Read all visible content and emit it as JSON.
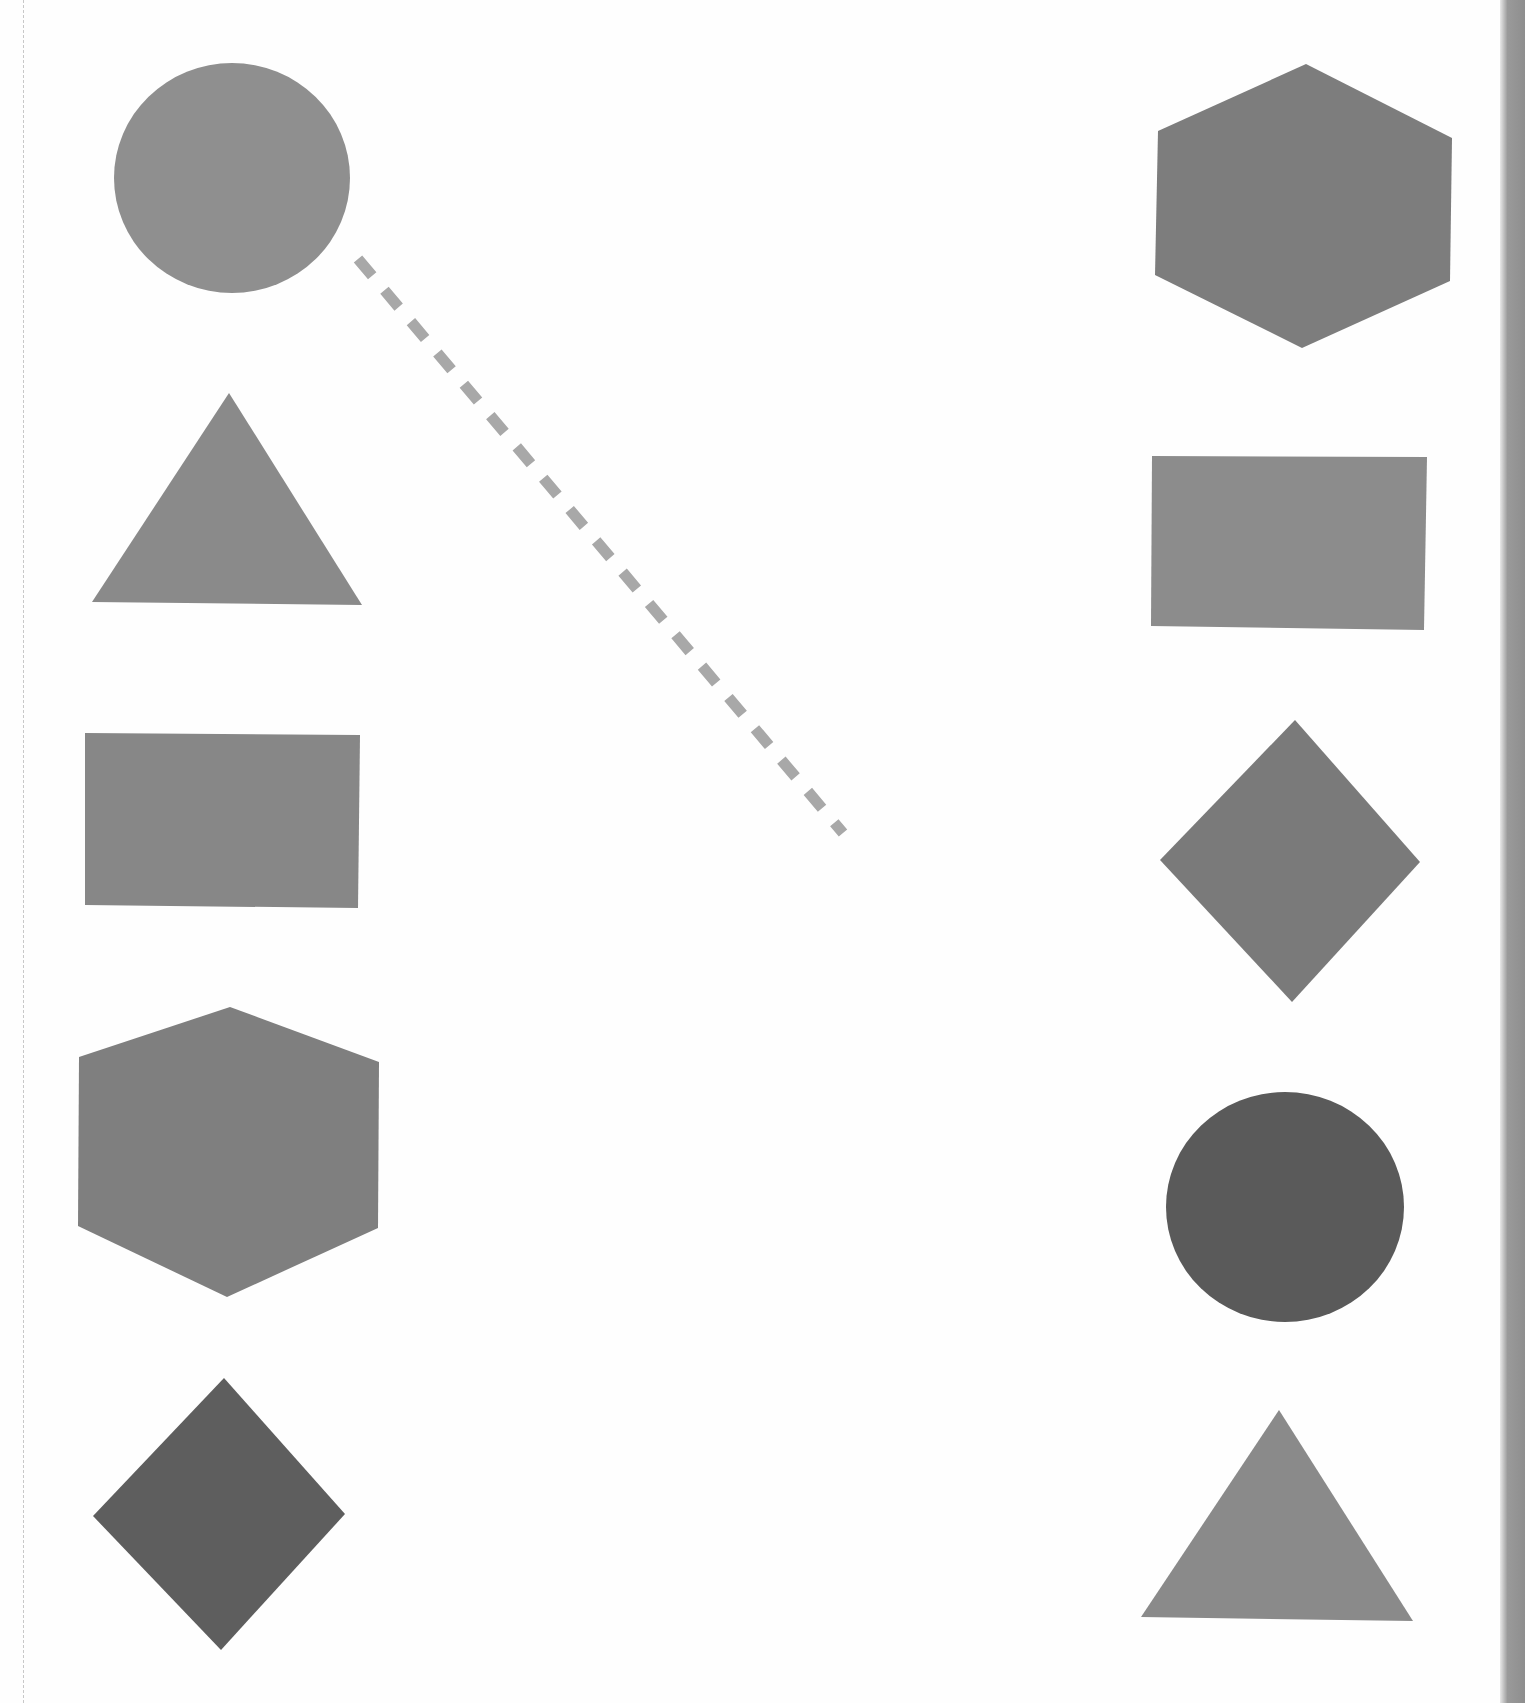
{
  "worksheet": {
    "type": "shape-matching",
    "left_column": [
      {
        "shape": "circle",
        "color": "#8f8f8f"
      },
      {
        "shape": "triangle",
        "color": "#8a8a8a"
      },
      {
        "shape": "rectangle",
        "color": "#878787"
      },
      {
        "shape": "hexagon",
        "color": "#7f7f7f"
      },
      {
        "shape": "diamond",
        "color": "#5e5e5e"
      }
    ],
    "right_column": [
      {
        "shape": "hexagon",
        "color": "#7d7d7d"
      },
      {
        "shape": "rectangle",
        "color": "#8c8c8c"
      },
      {
        "shape": "diamond",
        "color": "#7a7a7a"
      },
      {
        "shape": "circle",
        "color": "#5a5a5a"
      },
      {
        "shape": "triangle",
        "color": "#8a8a8a"
      }
    ],
    "example_connection": {
      "from": "left circle",
      "style": "dashed",
      "color": "#a8a8a8"
    }
  },
  "colors": {
    "background": "#fefefe",
    "dashed_line": "#a8a8a8",
    "page_edge": "#909090"
  }
}
